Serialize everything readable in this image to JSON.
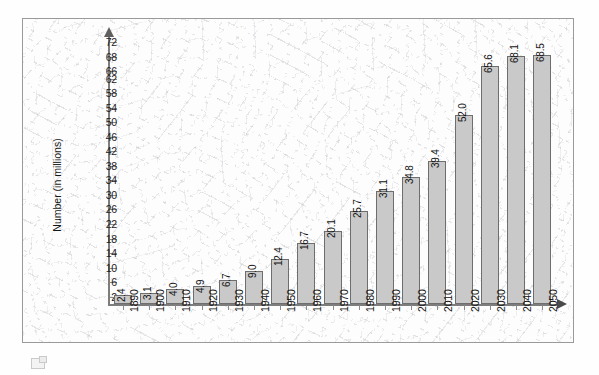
{
  "chart_data": {
    "type": "bar",
    "title": "",
    "subtitle": "",
    "xlabel": "",
    "ylabel": "Number (in millions)",
    "categories": [
      "1890",
      "1900",
      "1910",
      "1920",
      "1930",
      "1940",
      "1950",
      "1960",
      "1970",
      "1980",
      "1990",
      "2000",
      "2010",
      "2020",
      "2030",
      "2040",
      "2050"
    ],
    "values": [
      2.4,
      3.1,
      4.0,
      4.9,
      6.7,
      9.0,
      12.4,
      16.7,
      20.1,
      25.7,
      31.1,
      34.8,
      39.4,
      52.0,
      65.6,
      68.1,
      68.5
    ],
    "data_labels": [
      "2.4",
      "3.1",
      "4.0",
      "4.9",
      "6.7",
      "9.0",
      "12.4",
      "16.7",
      "20.1",
      "25.7",
      "31.1",
      "34.8",
      "39.4",
      "52.0",
      "65.6",
      "68.1",
      "68.5"
    ],
    "ylim": [
      0,
      74
    ],
    "y_tick_labels": [
      "72",
      "68",
      "66",
      "62",
      "58",
      "54",
      "50",
      "46",
      "42",
      "38",
      "34",
      "30",
      "26",
      "22",
      "18",
      "14",
      "10",
      "6",
      "2"
    ],
    "y_tick_values": [
      72,
      68,
      64,
      62,
      58,
      54,
      50,
      46,
      42,
      38,
      34,
      30,
      26,
      22,
      18,
      14,
      10,
      6,
      2
    ],
    "grid": false,
    "legend": null,
    "legend_position": "none",
    "bar_fill_color": "#c9c9c9",
    "bar_border_color": "#6e6e6e",
    "axis_color": "#7d7d7d",
    "text_color": "#141414"
  },
  "frame": {
    "border_color": "#9a9a9a",
    "background_color": "#fdfdfd"
  },
  "footer": {
    "icon_name": "page-thumbnail-icon"
  }
}
